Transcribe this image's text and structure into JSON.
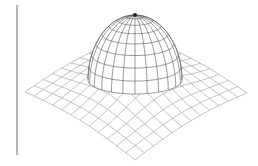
{
  "figure": {
    "background": "#ffffff",
    "divider": {
      "color": "#b8b8b8",
      "x": 16,
      "y_top": 5,
      "y_bottom": 155
    },
    "sheet": {
      "color": "#a8a8a8",
      "grid_lines": 12,
      "corners": {
        "left": [
          25,
          87
        ],
        "right": [
          247,
          88
        ],
        "bottom": [
          135,
          155
        ],
        "top": [
          135,
          30
        ]
      },
      "sag": 10
    },
    "dome": {
      "color": "#555555",
      "pole": [
        135,
        15
      ],
      "center_x": 135,
      "base_y": 80,
      "radius_x": 47,
      "radius_y": 14,
      "height": 65,
      "latitude_lines": 8,
      "longitude_lines": 24
    }
  }
}
